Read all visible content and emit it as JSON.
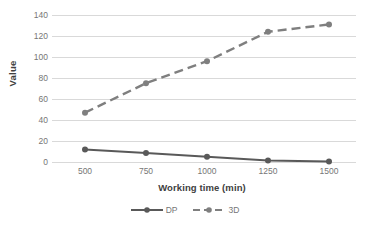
{
  "chart_data": {
    "type": "line",
    "title": "",
    "xlabel": "Working time (min)",
    "ylabel": "Value",
    "categories": [
      "500",
      "750",
      "1000",
      "1250",
      "1500"
    ],
    "x": [
      500,
      750,
      1000,
      1250,
      1500
    ],
    "series": [
      {
        "name": "DP",
        "values": [
          12,
          8.5,
          5,
          1.5,
          0.5
        ],
        "style": "solid",
        "color": "#595959",
        "marker": "circle"
      },
      {
        "name": "3D",
        "values": [
          47,
          75,
          96,
          124,
          131
        ],
        "style": "dashed",
        "color": "#7f7f7f",
        "marker": "circle"
      }
    ],
    "yticks": [
      0,
      20,
      40,
      60,
      80,
      100,
      120,
      140
    ],
    "ytick_labels": [
      "0",
      "20",
      "40",
      "60",
      "80",
      "100",
      "120",
      "140"
    ],
    "ylim": [
      0,
      140
    ],
    "grid": "horizontal",
    "legend_position": "bottom",
    "legend_entries": [
      "DP",
      "3D"
    ],
    "colors": {
      "gridline": "#d9d9d9",
      "axis_text": "#767676",
      "title_text": "#404040",
      "series_dp": "#595959",
      "series_3d": "#7f7f7f",
      "background": "#ffffff"
    }
  }
}
